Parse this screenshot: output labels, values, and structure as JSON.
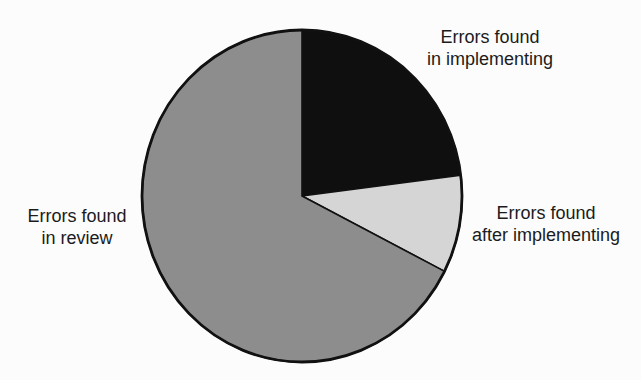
{
  "figure": {
    "background_color": "#fcfcfc",
    "outline_color": "#111111",
    "text_color": "#1b1b1b"
  },
  "chart_data": {
    "type": "pie",
    "title": "",
    "start_angle_deg": 0,
    "direction": "clockwise",
    "legend_position": "labels-outside",
    "slices": [
      {
        "name": "errors-found-in-implementing",
        "label": "Errors found in implementing",
        "label_lines": [
          "Errors found",
          "in implementing"
        ],
        "percent": 23,
        "color": "#0f0f0f"
      },
      {
        "name": "errors-found-after-implementing",
        "label": "Errors found after implementing",
        "label_lines": [
          "Errors found",
          "after implementing"
        ],
        "percent": 9.5,
        "color": "#d5d5d5"
      },
      {
        "name": "errors-found-in-review",
        "label": "Errors found in review",
        "label_lines": [
          "Errors found",
          "in review"
        ],
        "percent": 67.5,
        "color": "#8d8d8d"
      }
    ]
  }
}
